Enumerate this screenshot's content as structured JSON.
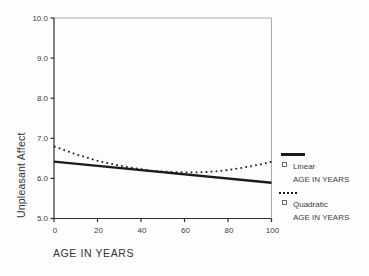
{
  "chart_data": {
    "type": "line",
    "title": "",
    "xlabel": "AGE IN YEARS",
    "ylabel": "Unpleasant Affect",
    "xlim": [
      0,
      100
    ],
    "ylim": [
      5.0,
      10.0
    ],
    "x_ticks": [
      0,
      20,
      40,
      60,
      80,
      100
    ],
    "y_ticks": [
      5.0,
      6.0,
      7.0,
      8.0,
      9.0,
      10.0
    ],
    "grid": false,
    "legend_position": "right-outside",
    "series": [
      {
        "name": "Linear",
        "sublabel": "AGE IN YEARS",
        "style": "solid",
        "color": "#1c1c1c",
        "x": [
          0,
          100
        ],
        "y": [
          6.42,
          5.89
        ]
      },
      {
        "name": "Quadratic",
        "sublabel": "AGE IN YEARS",
        "style": "dotted",
        "color": "#1c1c1c",
        "x": [
          0,
          5,
          10,
          15,
          20,
          25,
          30,
          35,
          40,
          45,
          50,
          55,
          60,
          65,
          70,
          75,
          80,
          85,
          90,
          95,
          100
        ],
        "y": [
          6.8,
          6.7,
          6.6,
          6.52,
          6.44,
          6.38,
          6.32,
          6.27,
          6.23,
          6.19,
          6.17,
          6.16,
          6.15,
          6.15,
          6.16,
          6.18,
          6.21,
          6.25,
          6.3,
          6.35,
          6.42
        ]
      }
    ]
  },
  "colors": {
    "axis": "#2e2e2e",
    "frame": "#ababab",
    "tick_text": "#3d3d3d",
    "background": "#fdfdfd"
  }
}
